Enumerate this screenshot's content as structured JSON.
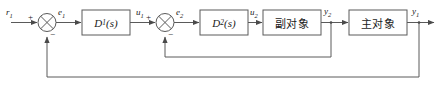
{
  "diagram": {
    "type": "control-block-diagram",
    "stroke_color": "#555555",
    "text_color": "#1a1a1a",
    "background": "#ffffff",
    "signals": {
      "input_r1": "r",
      "input_r1_sub": "1",
      "error_e1": "e",
      "error_e1_sub": "1",
      "ctrl_u1": "u",
      "ctrl_u1_sub": "1",
      "error_e2": "e",
      "error_e2_sub": "2",
      "ctrl_u2": "u",
      "ctrl_u2_sub": "2",
      "out_y2": "y",
      "out_y2_sub": "2",
      "out_y1": "y",
      "out_y1_sub": "1"
    },
    "signs": {
      "sum1_plus": "+",
      "sum1_minus": "−",
      "sum2_plus": "+",
      "sum2_minus": "−"
    },
    "blocks": [
      {
        "name": "primary-controller",
        "label": "D",
        "sub": "1",
        "suffix": "(s)"
      },
      {
        "name": "secondary-controller",
        "label": "D",
        "sub": "2",
        "suffix": "(s)"
      },
      {
        "name": "secondary-plant",
        "label": "副对象"
      },
      {
        "name": "primary-plant",
        "label": "主对象"
      }
    ]
  }
}
